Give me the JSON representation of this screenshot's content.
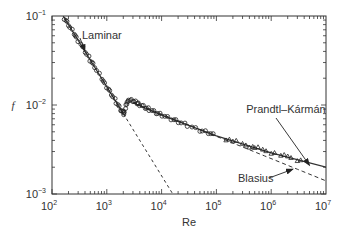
{
  "chart_data": {
    "type": "scatter",
    "title": "",
    "xlabel": "Re",
    "ylabel": "f",
    "xscale": "log",
    "yscale": "log",
    "xlim": [
      100,
      10000000
    ],
    "ylim": [
      0.001,
      0.1
    ],
    "grid": false,
    "x_ticks": [
      {
        "base": "10",
        "exp": "2",
        "value": 100
      },
      {
        "base": "10",
        "exp": "3",
        "value": 1000
      },
      {
        "base": "10",
        "exp": "4",
        "value": 10000
      },
      {
        "base": "10",
        "exp": "5",
        "value": 100000
      },
      {
        "base": "10",
        "exp": "6",
        "value": 1000000
      },
      {
        "base": "10",
        "exp": "7",
        "value": 10000000
      }
    ],
    "y_ticks": [
      {
        "base": "10",
        "exp": "−1",
        "value": 0.1
      },
      {
        "base": "10",
        "exp": "−2",
        "value": 0.01
      },
      {
        "base": "10",
        "exp": "−3",
        "value": 0.001
      }
    ],
    "annotations": [
      {
        "text": "Laminar",
        "points_to": {
          "re": 400,
          "f": 0.04
        }
      },
      {
        "text": "Prandtl–Kármán",
        "points_to": {
          "re": 5000000,
          "f": 0.0021
        }
      },
      {
        "text": "Blasius",
        "points_to": {
          "re": 2500000,
          "f": 0.0019
        }
      }
    ],
    "series": [
      {
        "name": "Laminar",
        "kind": "line",
        "style": "solid-then-dashed",
        "formula": "f = 16/Re",
        "x": [
          160,
          200,
          500,
          1000,
          2000,
          5000,
          10000,
          16000
        ],
        "y": [
          0.1,
          0.08,
          0.032,
          0.016,
          0.008,
          0.0032,
          0.0016,
          0.001
        ]
      },
      {
        "name": "Prandtl–Kármán",
        "kind": "line",
        "style": "solid",
        "x": [
          3000,
          10000,
          100000,
          1000000,
          10000000
        ],
        "y": [
          0.0106,
          0.0077,
          0.0045,
          0.0029,
          0.002
        ]
      },
      {
        "name": "Blasius",
        "kind": "line",
        "style": "dashed",
        "formula": "f = 0.079 Re^-0.25",
        "x": [
          3000,
          10000,
          100000,
          1000000,
          10000000
        ],
        "y": [
          0.0107,
          0.0079,
          0.0044,
          0.0025,
          0.0014
        ]
      },
      {
        "name": "Experimental data (circles)",
        "kind": "scatter",
        "marker": "circle",
        "x": [
          170,
          200,
          250,
          300,
          400,
          500,
          600,
          800,
          1000,
          1200,
          1500,
          1800,
          2000,
          2100,
          2300,
          2500,
          3000,
          3500,
          4000,
          5000,
          6000,
          8000,
          10000,
          15000,
          20000,
          30000,
          50000,
          70000,
          100000
        ],
        "y": [
          0.094,
          0.08,
          0.064,
          0.053,
          0.04,
          0.032,
          0.027,
          0.02,
          0.016,
          0.0133,
          0.0107,
          0.0089,
          0.008,
          0.0085,
          0.0105,
          0.0113,
          0.0112,
          0.0106,
          0.0101,
          0.0094,
          0.0089,
          0.0082,
          0.0077,
          0.007,
          0.0065,
          0.0059,
          0.0052,
          0.0049,
          0.0045
        ]
      },
      {
        "name": "Experimental data (triangles)",
        "kind": "scatter",
        "marker": "triangle",
        "x": [
          150000,
          200000,
          300000,
          400000,
          500000,
          700000,
          1000000,
          1500000,
          2000000,
          3000000
        ],
        "y": [
          0.0041,
          0.0039,
          0.0036,
          0.0034,
          0.0033,
          0.0031,
          0.0029,
          0.0027,
          0.0026,
          0.0024
        ]
      }
    ]
  }
}
